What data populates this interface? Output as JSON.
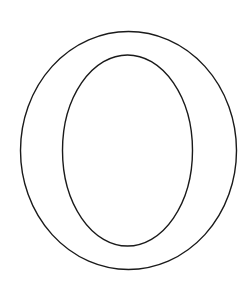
{
  "figure": {
    "letter": "O",
    "style": "outline",
    "stroke_color": "#1a1a1a",
    "background_color": "#ffffff"
  }
}
